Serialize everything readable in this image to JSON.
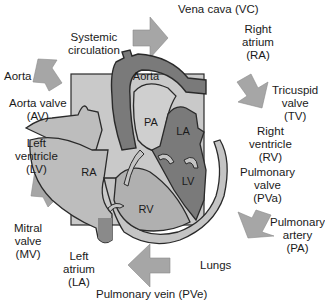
{
  "diagram": {
    "colors": {
      "background_box": "#c9c9c9",
      "arrow": "#a6a6a6",
      "dark_chamber": "#7a7a7a",
      "light_chamber": "#bdbdbd",
      "outline": "#2a2a2a"
    },
    "heart_labels": {
      "aorta": "Aorta",
      "pa": "PA",
      "la": "LA",
      "lv": "LV",
      "ra": "RA",
      "rv": "RV"
    },
    "flow_labels": {
      "vena_cava": "Vena cava (VC)",
      "right_atrium": [
        "Right",
        "atrium",
        "(RA)"
      ],
      "tricuspid_valve": [
        "Tricuspid",
        "valve",
        "(TV)"
      ],
      "right_ventricle": [
        "Right",
        "ventricle",
        "(RV)"
      ],
      "pulmonary_valve": [
        "Pulmonary",
        "valve",
        "(PVa)"
      ],
      "pulmonary_artery": [
        "Pulmonary",
        "artery",
        "(PA)"
      ],
      "lungs": "Lungs",
      "pulmonary_vein": "Pulmonary vein (PVe)",
      "left_atrium": [
        "Left",
        "atrium",
        "(LA)"
      ],
      "mitral_valve": [
        "Mitral",
        "valve",
        "(MV)"
      ],
      "left_ventricle": [
        "Left",
        "ventricle",
        "(LV)"
      ],
      "aorta_valve": [
        "Aorta valve",
        "(AV)"
      ],
      "aorta": "Aorta",
      "systemic_circulation": [
        "Systemic",
        "circulation"
      ]
    }
  }
}
